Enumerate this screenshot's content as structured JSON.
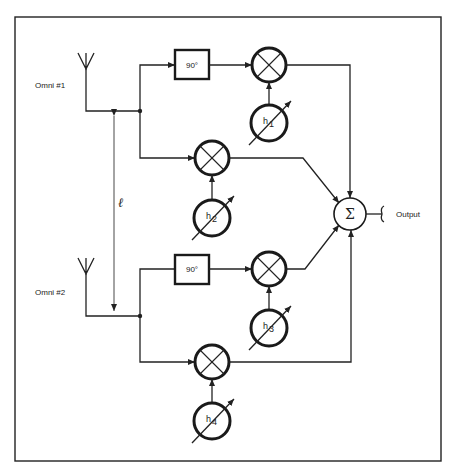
{
  "diagram": {
    "antennas": [
      {
        "label": "Omni #1"
      },
      {
        "label": "Omni #2"
      }
    ],
    "spacing_label": "ℓ",
    "phase_shifters": [
      {
        "label": "90°"
      },
      {
        "label": "90°"
      }
    ],
    "weights": [
      {
        "symbol": "h",
        "index": "1"
      },
      {
        "symbol": "h",
        "index": "2"
      },
      {
        "symbol": "h",
        "index": "3"
      },
      {
        "symbol": "h",
        "index": "4"
      }
    ],
    "summer": {
      "symbol": "Σ"
    },
    "output_label": "Output",
    "colors": {
      "line": "#222222",
      "background": "#ffffff"
    }
  }
}
